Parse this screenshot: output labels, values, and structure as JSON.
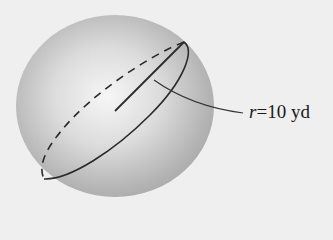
{
  "figure": {
    "label": {
      "variable": "r",
      "equals": "=",
      "value": "10",
      "unit": "yd"
    }
  },
  "colors": {
    "background": "#efefef",
    "sphere_highlight": "#f4f4f4",
    "sphere_shadow": "#9a9a9a",
    "line": "#2a2a2a"
  }
}
